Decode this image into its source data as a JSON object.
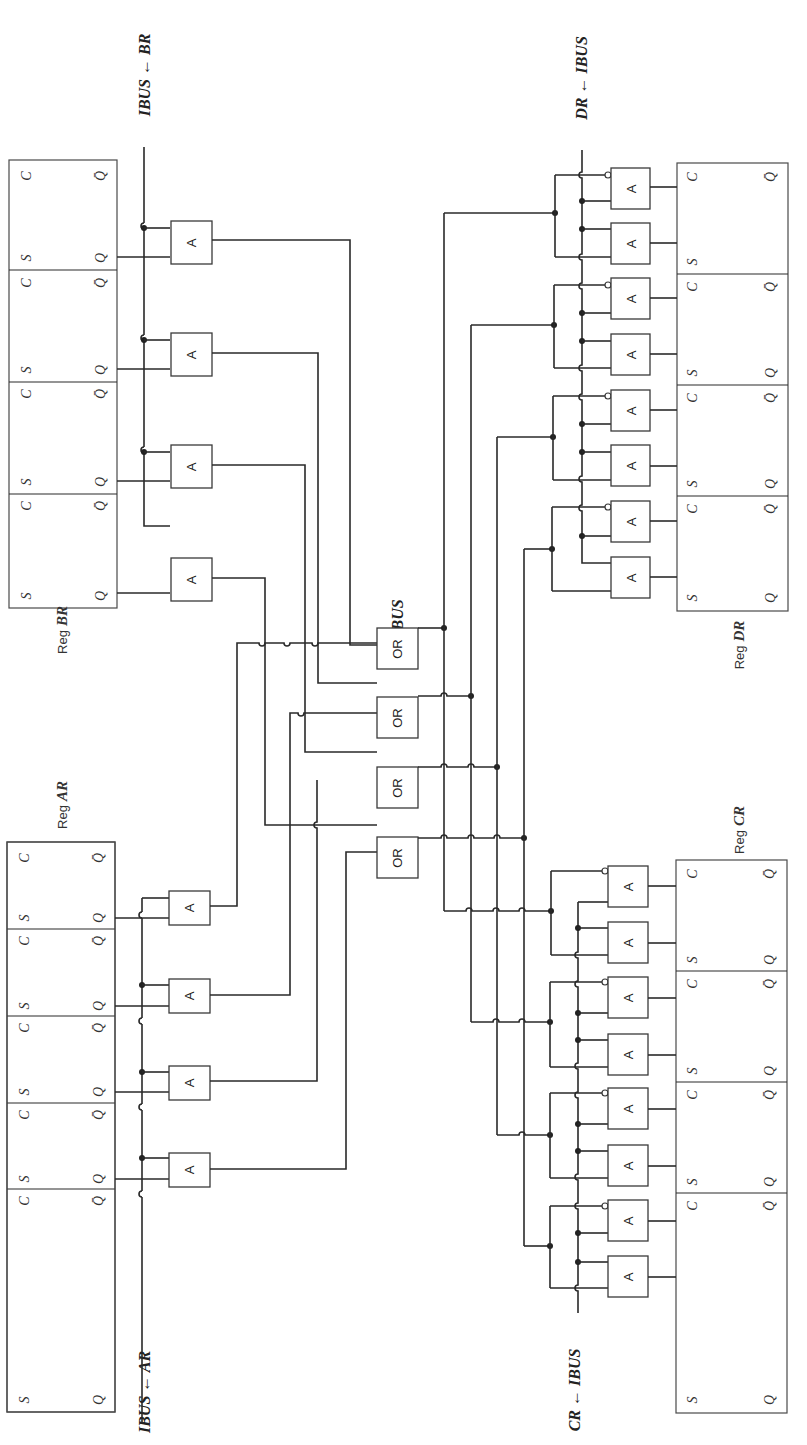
{
  "diagram": {
    "orientation": "rotated 90 degrees counter-clockwise",
    "colors": {
      "ink": "#2a2a2a",
      "background": "#ffffff"
    }
  },
  "registers": {
    "BR": {
      "label_prefix": "Reg",
      "label_name": "BR",
      "cells": 4,
      "pins": {
        "set": "S",
        "clock": "C",
        "q": "Q",
        "qbar": "Q̄"
      }
    },
    "AR": {
      "label_prefix": "Reg",
      "label_name": "AR",
      "cells": 4,
      "pins": {
        "set": "S",
        "clock": "C",
        "q": "Q",
        "qbar": "Q̄"
      }
    },
    "DR": {
      "label_prefix": "Reg",
      "label_name": "DR",
      "cells": 4,
      "pins": {
        "set": "S",
        "clock": "C",
        "q": "Q",
        "qbar": "Q̄"
      }
    },
    "CR": {
      "label_prefix": "Reg",
      "label_name": "CR",
      "cells": 4,
      "pins": {
        "set": "S",
        "clock": "C",
        "q": "Q",
        "qbar": "Q̄"
      }
    }
  },
  "signals": {
    "br_out": "IBUS ← BR",
    "ar_out": "IBUS ← AR",
    "dr_in": "DR ← IBUS",
    "cr_in": "CR ← IBUS",
    "bus_label": "IBUS"
  },
  "gates": {
    "and_label": "A",
    "or_label": "OR",
    "and_count_output_side": 8,
    "and_count_input_side": 16,
    "or_count": 4
  }
}
